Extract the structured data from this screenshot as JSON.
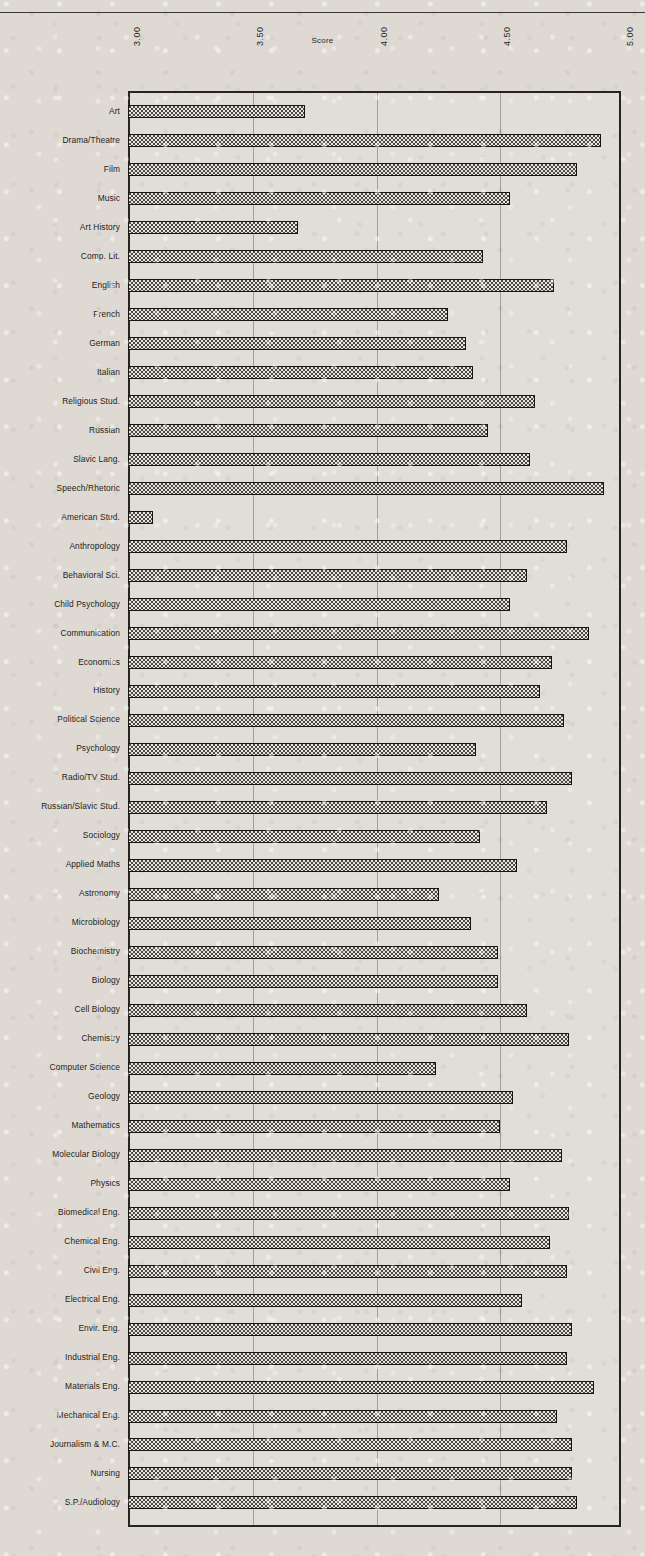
{
  "page": {
    "background_color": "#dedad3",
    "ink_color": "#1e1c19"
  },
  "header": {
    "title": "",
    "rule_visible": true
  },
  "axis": {
    "label": "Score",
    "ticks": [
      "3.00",
      "3.50",
      "4.00",
      "4.50",
      "5.00"
    ],
    "tick_values": [
      3.0,
      3.5,
      4.0,
      4.5,
      5.0
    ],
    "min": 3.0,
    "max": 5.0
  },
  "chart_data": {
    "type": "bar",
    "orientation": "horizontal",
    "title": "Score",
    "xlabel": "Score",
    "ylabel": "",
    "xlim": [
      3.0,
      5.0
    ],
    "grid": true,
    "legend": "none",
    "bar_fill": "checkerboard-hatch",
    "categories": [
      "Art",
      "Drama/Theatre",
      "Film",
      "Music",
      "Art History",
      "Comp. Lit.",
      "English",
      "French",
      "German",
      "Italian",
      "Religious Stud.",
      "Russian",
      "Slavic Lang.",
      "Speech/Rhetoric",
      "American Stud.",
      "Anthropology",
      "Behavioral Sci.",
      "Child Psychology",
      "Communication",
      "Economics",
      "History",
      "Political  Science",
      "Psychology",
      "Radio/TV Stud.",
      "Russian/Slavic Stud.",
      "Sociology",
      "Applied Maths",
      "Astronomy",
      "Microbiology",
      "Biochemistry",
      "Biology",
      "Cell Biology",
      "Chemistry",
      "Computer Science",
      "Geology",
      "Mathematics",
      "Molecular Biology",
      "Physics",
      "Biomedical Eng.",
      "Chemical Eng.",
      "Civil Eng.",
      "Electrical Eng.",
      "Envir. Eng.",
      "Industrial Eng.",
      "Materials  Eng.",
      "Mechanical Eng.",
      "Journalism & M.C.",
      "Nursing",
      "S.P./Audiology"
    ],
    "values": [
      3.72,
      4.92,
      4.82,
      4.55,
      3.69,
      4.44,
      4.73,
      4.3,
      4.37,
      4.4,
      4.65,
      4.46,
      4.63,
      4.93,
      3.1,
      4.78,
      4.62,
      4.55,
      4.87,
      4.72,
      4.67,
      4.77,
      4.41,
      4.8,
      4.7,
      4.43,
      4.58,
      4.26,
      4.39,
      4.5,
      4.5,
      4.62,
      4.79,
      4.25,
      4.56,
      4.51,
      4.76,
      4.55,
      4.79,
      4.71,
      4.78,
      4.6,
      4.8,
      4.78,
      4.89,
      4.74,
      4.8,
      4.8,
      4.82
    ]
  }
}
